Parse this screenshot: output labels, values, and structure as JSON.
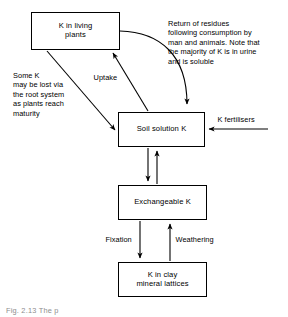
{
  "figure": {
    "title_visible": false,
    "caption": "Fig. 2.13  The p",
    "background_color": "#ffffff",
    "line_color": "#000000"
  },
  "nodes": [
    {
      "id": "k-in-living-plants",
      "label": "K in living\nplants",
      "x": 31,
      "y": 12,
      "w": 89,
      "h": 38
    },
    {
      "id": "soil-solution-k",
      "label": "Soil solution K",
      "x": 118,
      "y": 112,
      "w": 87,
      "h": 35
    },
    {
      "id": "exchangeable-k",
      "label": "Exchangeable K",
      "x": 118,
      "y": 185,
      "w": 89,
      "h": 35
    },
    {
      "id": "k-in-clay-mineral-lattices",
      "label": "K in clay\nmineral lattices",
      "x": 118,
      "y": 262,
      "w": 89,
      "h": 35
    }
  ],
  "annotations": [
    {
      "id": "return-of-residues",
      "text": "Return of residues\nfollowing consumption by\nman and animals. Note that\nthe majority of K is in urine\nand is soluble",
      "x": 168,
      "y": 19
    },
    {
      "id": "some-k-may-be-lost",
      "text": "Some K\nmay be lost via\nthe root system\nas plants reach\nmaturity",
      "x": 13,
      "y": 71
    }
  ],
  "edge_labels": [
    {
      "id": "uptake",
      "text": "Uptake",
      "x": 92,
      "y": 73
    },
    {
      "id": "fixation",
      "text": "Fixation",
      "x": 111,
      "y": 236
    },
    {
      "id": "weathering",
      "text": "Weathering",
      "x": 172,
      "y": 236
    },
    {
      "id": "k-fertilisers",
      "text": "K fertilisers",
      "x": 238,
      "y": 116
    }
  ],
  "edges": [
    {
      "id": "plants-to-soil-residues",
      "from": "k-in-living-plants",
      "to": "soil-solution-k",
      "style": "curved",
      "direction": "down"
    },
    {
      "id": "soil-to-plants-uptake",
      "from": "soil-solution-k",
      "to": "k-in-living-plants",
      "style": "straight",
      "direction": "up",
      "label": "Uptake"
    },
    {
      "id": "plants-root-loss-to-soil",
      "from": "k-in-living-plants",
      "to": "soil-solution-k",
      "style": "straight",
      "direction": "down"
    },
    {
      "id": "fertilisers-to-soil",
      "from": "k-fertilisers",
      "to": "soil-solution-k",
      "style": "straight",
      "direction": "left",
      "label": "K fertilisers"
    },
    {
      "id": "soil-to-exchangeable",
      "from": "soil-solution-k",
      "to": "exchangeable-k",
      "style": "straight",
      "direction": "down"
    },
    {
      "id": "exchangeable-to-soil",
      "from": "exchangeable-k",
      "to": "soil-solution-k",
      "style": "straight",
      "direction": "up"
    },
    {
      "id": "exchangeable-to-clay-fixation",
      "from": "exchangeable-k",
      "to": "k-in-clay-mineral-lattices",
      "style": "straight",
      "direction": "down",
      "label": "Fixation"
    },
    {
      "id": "clay-to-exchangeable-weathering",
      "from": "k-in-clay-mineral-lattices",
      "to": "exchangeable-k",
      "style": "straight",
      "direction": "up",
      "label": "Weathering"
    }
  ]
}
